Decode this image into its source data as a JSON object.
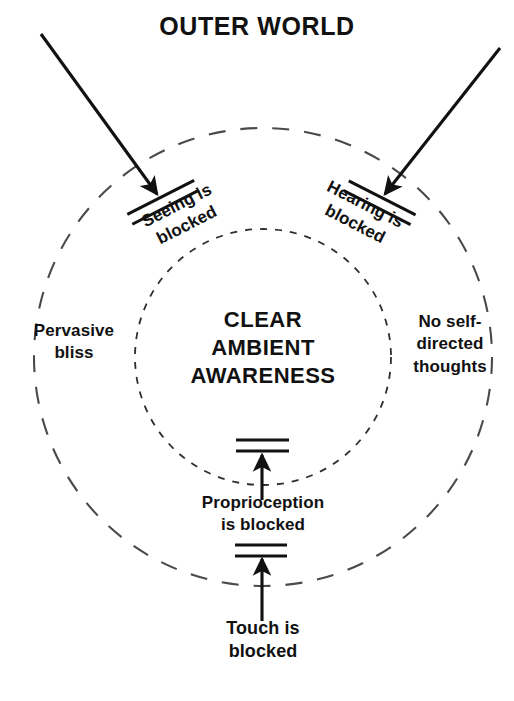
{
  "diagram": {
    "title": "OUTER WORLD",
    "center_label": "CLEAR\nAMBIENT\nAWARENESS",
    "left_label": "Pervasive\nbliss",
    "right_label": "No self-\ndirected\nthoughts",
    "seeing_label": "Seeing is\nblocked",
    "hearing_label": "Hearing is\nblocked",
    "proprioception_label": "Proprioception\nis blocked",
    "touch_label": "Touch is\nblocked",
    "colors": {
      "ink": "#111111",
      "background": "#ffffff",
      "circle_stroke": "#4a4a4a",
      "inner_circle_stroke": "#2e2e2e"
    },
    "geometry": {
      "center_x": 263,
      "center_y": 357,
      "outer_circle_radius": 229,
      "inner_circle_radius": 128,
      "outer_dash": "16 14",
      "inner_dash": "7 8"
    },
    "arrows": [
      {
        "name": "seeing-arrow",
        "x1": 41,
        "y1": 34,
        "x2": 159,
        "y2": 197
      },
      {
        "name": "hearing-arrow",
        "x1": 500,
        "y1": 48,
        "x2": 383,
        "y2": 197
      },
      {
        "name": "proprioception-arrow",
        "x1": 262,
        "y1": 500,
        "x2": 262,
        "y2": 453
      },
      {
        "name": "touch-arrow",
        "x1": 262,
        "y1": 621,
        "x2": 262,
        "y2": 557
      }
    ],
    "barriers": [
      {
        "name": "seeing-barrier",
        "rotation_deg": -27
      },
      {
        "name": "hearing-barrier",
        "rotation_deg": 27
      },
      {
        "name": "proprioception-barrier",
        "rotation_deg": 0
      },
      {
        "name": "touch-barrier",
        "rotation_deg": 0
      }
    ]
  }
}
